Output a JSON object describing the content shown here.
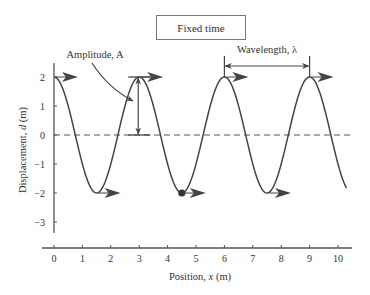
{
  "chart_data": {
    "type": "line",
    "title": "Fixed time",
    "xlabel": "Position, x (m)",
    "ylabel": "Displacement, d (m)",
    "xlim": [
      0,
      10.3
    ],
    "ylim": [
      -3.5,
      2.5
    ],
    "xticks": [
      0,
      1,
      2,
      3,
      4,
      5,
      6,
      7,
      8,
      9,
      10
    ],
    "yticks": [
      2,
      1,
      0,
      -1,
      -2,
      -3
    ],
    "grid": false,
    "legend": null,
    "series": [
      {
        "name": "wave",
        "function": "d = 2 cos(2*pi*x/3)",
        "amplitude": 2,
        "wavelength": 3,
        "x": [
          0,
          0.75,
          1.5,
          2.25,
          3,
          3.75,
          4.5,
          5.25,
          6,
          6.75,
          7.5,
          8.25,
          9,
          9.75,
          10.3
        ],
        "y": [
          2,
          0,
          -2,
          0,
          2,
          0,
          -2,
          0,
          2,
          0,
          -2,
          0,
          2,
          0,
          -1.82
        ]
      }
    ],
    "reference_line": {
      "y": 0,
      "style": "dashed"
    },
    "marked_point": {
      "x": 4.5,
      "y": -2
    },
    "direction_arrows_at": [
      {
        "x": 0,
        "y": 2
      },
      {
        "x": 1.5,
        "y": -2
      },
      {
        "x": 3,
        "y": 2
      },
      {
        "x": 4.5,
        "y": -2
      },
      {
        "x": 6,
        "y": 2
      },
      {
        "x": 7.5,
        "y": -2
      },
      {
        "x": 9,
        "y": 2
      }
    ],
    "annotations": [
      {
        "text": "Amplitude, A",
        "indicates": "vertical span from d=0 to d=2 at x=3"
      },
      {
        "text": "Wavelength, λ",
        "indicates": "horizontal span from x=6 to x=9 at peaks"
      }
    ]
  }
}
